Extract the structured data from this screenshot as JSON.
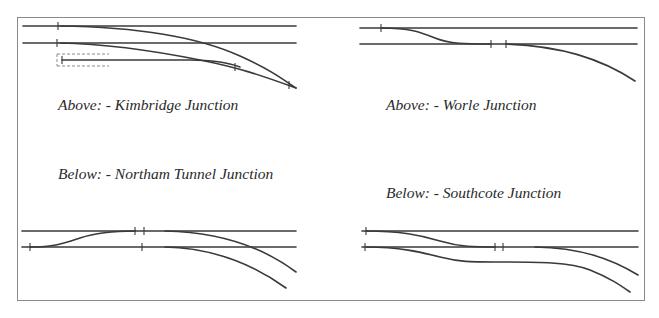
{
  "colors": {
    "track": "#3a3a3a",
    "frame": "#8a8a8a",
    "text": "#2a2a2a",
    "background": "#ffffff"
  },
  "diagrams": [
    {
      "id": "kimbridge",
      "caption": "Above: - Kimbridge Junction",
      "caption_pos": "above"
    },
    {
      "id": "worle",
      "caption": "Above: - Worle Junction",
      "caption_pos": "above"
    },
    {
      "id": "northam",
      "caption": "Below: - Northam Tunnel Junction",
      "caption_pos": "below"
    },
    {
      "id": "southcote",
      "caption": "Below: - Southcote Junction",
      "caption_pos": "below"
    }
  ]
}
